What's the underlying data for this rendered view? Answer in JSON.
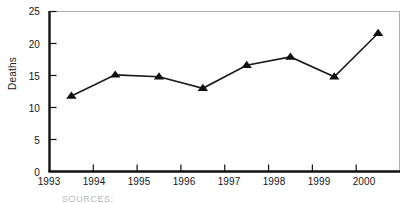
{
  "chart_data": {
    "type": "line",
    "title": "",
    "xlabel": "",
    "ylabel": "Deaths",
    "x": [
      1993.5,
      1994.5,
      1995.5,
      1996.5,
      1997.5,
      1998.5,
      1999.5,
      2000.5
    ],
    "values": [
      11.8,
      15.1,
      14.8,
      13.0,
      16.6,
      17.9,
      14.8,
      21.6
    ],
    "categories": [
      "1993",
      "1994",
      "1995",
      "1996",
      "1997",
      "1998",
      "1999",
      "2000"
    ],
    "xtick_labels": [
      "1993",
      "1994",
      "1995",
      "1996",
      "1997",
      "1998",
      "1999",
      "2000"
    ],
    "ytick_labels": [
      "0",
      "5",
      "10",
      "15",
      "20",
      "25"
    ],
    "ytick_values": [
      0,
      5,
      10,
      15,
      20,
      25
    ],
    "ylim": [
      0,
      25
    ],
    "xlim": [
      1993,
      2001
    ],
    "grid": false,
    "legend": false,
    "marker": "triangle",
    "line_color": "#1a1a1a",
    "marker_color": "#111111",
    "axis_color": "#111111",
    "frame_color": "#b0b0b0",
    "background": "#ffffff"
  },
  "footer": {
    "source_text": "SOURCES:"
  },
  "labels": {
    "y_axis_title": "Deaths"
  }
}
